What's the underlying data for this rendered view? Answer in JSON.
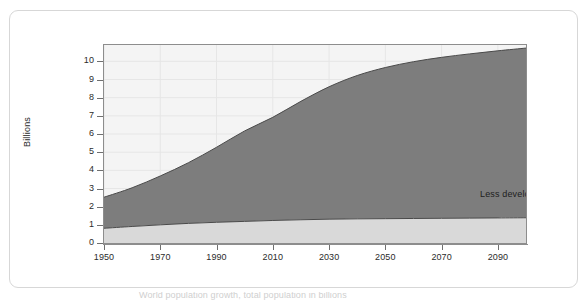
{
  "chart_data": {
    "type": "area",
    "title": "",
    "subtitle": "",
    "xlabel": "",
    "ylabel": "Billions",
    "xlim": [
      1950,
      2100
    ],
    "ylim": [
      0,
      10.9
    ],
    "grid": true,
    "stacked": true,
    "legend_position": "inside-plot-annotations",
    "y_ticks": [
      0,
      1,
      2,
      3,
      4,
      5,
      6,
      7,
      8,
      9,
      10
    ],
    "y_tick_labels": [
      "0",
      "1",
      "2",
      "3",
      "4",
      "5",
      "6",
      "7",
      "8",
      "9",
      "10"
    ],
    "x_ticks": [
      1950,
      1970,
      1990,
      2010,
      2030,
      2050,
      2070,
      2090
    ],
    "x_tick_labels": [
      "1950",
      "1970",
      "1990",
      "2010",
      "2030",
      "2050",
      "2070",
      "2090"
    ],
    "x": [
      1950,
      1960,
      1970,
      1980,
      1990,
      2000,
      2010,
      2020,
      2030,
      2040,
      2050,
      2060,
      2070,
      2080,
      2090,
      2100
    ],
    "series": [
      {
        "name": "More developed regions",
        "color": "#d9d9d9",
        "label_color": "#1e1e1e",
        "values": [
          0.81,
          0.91,
          1.0,
          1.08,
          1.14,
          1.19,
          1.24,
          1.28,
          1.31,
          1.33,
          1.34,
          1.35,
          1.36,
          1.37,
          1.38,
          1.39
        ]
      },
      {
        "name": "Less developed regions",
        "color": "#7d7d7d",
        "label_color": "#1e1e1e",
        "values": [
          1.71,
          2.13,
          2.69,
          3.34,
          4.13,
          4.98,
          5.68,
          6.52,
          7.29,
          7.89,
          8.32,
          8.63,
          8.86,
          9.04,
          9.2,
          9.34
        ]
      }
    ],
    "totals": [
      2.52,
      3.04,
      3.69,
      4.42,
      5.27,
      6.17,
      6.92,
      7.8,
      8.6,
      9.22,
      9.66,
      9.98,
      10.22,
      10.41,
      10.58,
      10.73
    ],
    "annotations": [
      {
        "text": "Less developed regions",
        "x": 2055,
        "y": 5.0
      },
      {
        "text": "More developed regions",
        "x": 2055,
        "y": 0.75
      }
    ],
    "colors": {
      "plot_background": "#f4f4f4",
      "axis": "#8d8d8d",
      "gridline": "#e6e6e6",
      "series_upper": "#7d7d7d",
      "series_lower": "#d9d9d9",
      "boundary_line": "#4a4a4a",
      "text": "#2b2b2b",
      "card_border": "#d7d7d7",
      "page_background": "#ffffff"
    }
  },
  "caption": {
    "text": "World population growth, total population in billions"
  }
}
